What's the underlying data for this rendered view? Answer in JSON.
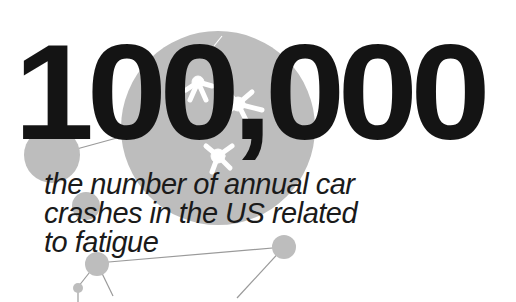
{
  "headline": {
    "number": "100,000"
  },
  "caption": {
    "lines": [
      "the number of annual car",
      "crashes in the US related",
      "to fatigue"
    ]
  },
  "colors": {
    "text": "#141414",
    "circle_fill": "#b9b9b9",
    "line": "#9a9a9a",
    "neuron": "#ffffff",
    "background": "#ffffff"
  }
}
